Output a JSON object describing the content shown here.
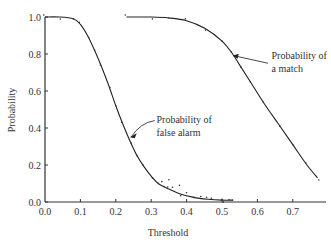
{
  "chart_data": {
    "type": "line",
    "title": "",
    "xlabel": "Threshold",
    "ylabel": "Probability",
    "xlim": [
      0.0,
      0.78
    ],
    "ylim": [
      0.0,
      1.0
    ],
    "grid": false,
    "x_ticks": [
      "0.0",
      "0.1",
      "0.2",
      "0.3",
      "0.4",
      "0.5",
      "0.6",
      "0.7"
    ],
    "y_ticks": [
      "0.0",
      "0.2",
      "0.4",
      "0.6",
      "0.8",
      "1.0"
    ],
    "series": [
      {
        "name": "Probability of false alarm",
        "style": "solid line with scattered sample dots",
        "x": [
          0.0,
          0.04,
          0.08,
          0.1,
          0.12,
          0.14,
          0.16,
          0.18,
          0.2,
          0.22,
          0.24,
          0.26,
          0.28,
          0.3,
          0.32,
          0.35,
          0.38,
          0.42,
          0.46,
          0.5,
          0.53
        ],
        "y": [
          1.0,
          1.0,
          0.99,
          0.96,
          0.9,
          0.82,
          0.73,
          0.63,
          0.52,
          0.42,
          0.33,
          0.25,
          0.19,
          0.14,
          0.1,
          0.07,
          0.045,
          0.025,
          0.015,
          0.01,
          0.01
        ]
      },
      {
        "name": "Probability of a match",
        "style": "solid line with sample dots",
        "x": [
          0.23,
          0.3,
          0.35,
          0.4,
          0.45,
          0.5,
          0.53,
          0.55,
          0.58,
          0.62,
          0.66,
          0.7,
          0.74,
          0.77
        ],
        "y": [
          1.0,
          1.0,
          0.995,
          0.98,
          0.94,
          0.87,
          0.8,
          0.74,
          0.65,
          0.53,
          0.42,
          0.31,
          0.2,
          0.13
        ]
      }
    ],
    "annotations": [
      {
        "text": [
          "Probability of",
          "false alarm"
        ],
        "points_to": [
          0.24,
          0.35
        ]
      },
      {
        "text": [
          "Probability of",
          "a match"
        ],
        "points_to": [
          0.53,
          0.79
        ]
      }
    ]
  }
}
